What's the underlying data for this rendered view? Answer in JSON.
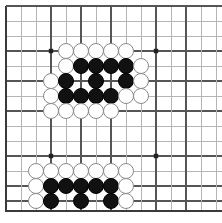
{
  "board": {
    "game": "go",
    "label": "go-board",
    "size": 14,
    "origin_x": 6,
    "origin_y": 6,
    "spacing": 15,
    "stone_radius": 8,
    "cols_visible": 14,
    "rows_visible": 14,
    "colors": {
      "background": "#ffffff",
      "grid_line": "#b5b5b5",
      "grid_line_strong": "#555555",
      "edge_line": "#3a3a3a",
      "black_stone": "#111111",
      "white_stone": "#ffffff",
      "white_stone_border": "#8a8a8a",
      "star_point": "#222222"
    },
    "edges": {
      "left_x": 6,
      "top_y": 6,
      "bottom_y": 211,
      "right_x": 222
    },
    "star_points": [
      {
        "col": 3,
        "row": 3
      },
      {
        "col": 10,
        "row": 3
      },
      {
        "col": 3,
        "row": 10
      },
      {
        "col": 10,
        "row": 10
      }
    ],
    "strong_lines": {
      "vertical_cols": [
        0,
        3,
        5,
        7,
        10,
        12
      ],
      "horizontal_rows": [
        0,
        3,
        5,
        7,
        10,
        12,
        13
      ]
    },
    "stones": [
      {
        "col": 4,
        "row": 3,
        "color": "white"
      },
      {
        "col": 5,
        "row": 3,
        "color": "white"
      },
      {
        "col": 6,
        "row": 3,
        "color": "white"
      },
      {
        "col": 7,
        "row": 3,
        "color": "white"
      },
      {
        "col": 8,
        "row": 3,
        "color": "white"
      },
      {
        "col": 4,
        "row": 4,
        "color": "white"
      },
      {
        "col": 5,
        "row": 4,
        "color": "black"
      },
      {
        "col": 6,
        "row": 4,
        "color": "black"
      },
      {
        "col": 7,
        "row": 4,
        "color": "black"
      },
      {
        "col": 8,
        "row": 4,
        "color": "black"
      },
      {
        "col": 9,
        "row": 4,
        "color": "white"
      },
      {
        "col": 3,
        "row": 5,
        "color": "white"
      },
      {
        "col": 4,
        "row": 5,
        "color": "black"
      },
      {
        "col": 6,
        "row": 5,
        "color": "black"
      },
      {
        "col": 8,
        "row": 5,
        "color": "black"
      },
      {
        "col": 9,
        "row": 5,
        "color": "white"
      },
      {
        "col": 3,
        "row": 6,
        "color": "white"
      },
      {
        "col": 4,
        "row": 6,
        "color": "black"
      },
      {
        "col": 5,
        "row": 6,
        "color": "black"
      },
      {
        "col": 6,
        "row": 6,
        "color": "black"
      },
      {
        "col": 7,
        "row": 6,
        "color": "black"
      },
      {
        "col": 8,
        "row": 6,
        "color": "white"
      },
      {
        "col": 9,
        "row": 6,
        "color": "white"
      },
      {
        "col": 3,
        "row": 7,
        "color": "white"
      },
      {
        "col": 4,
        "row": 7,
        "color": "white"
      },
      {
        "col": 5,
        "row": 7,
        "color": "white"
      },
      {
        "col": 6,
        "row": 7,
        "color": "white"
      },
      {
        "col": 7,
        "row": 7,
        "color": "white"
      },
      {
        "col": 2,
        "row": 11,
        "color": "white"
      },
      {
        "col": 3,
        "row": 11,
        "color": "white"
      },
      {
        "col": 4,
        "row": 11,
        "color": "white"
      },
      {
        "col": 5,
        "row": 11,
        "color": "white"
      },
      {
        "col": 6,
        "row": 11,
        "color": "white"
      },
      {
        "col": 7,
        "row": 11,
        "color": "white"
      },
      {
        "col": 8,
        "row": 11,
        "color": "white"
      },
      {
        "col": 2,
        "row": 12,
        "color": "white"
      },
      {
        "col": 3,
        "row": 12,
        "color": "black"
      },
      {
        "col": 4,
        "row": 12,
        "color": "black"
      },
      {
        "col": 5,
        "row": 12,
        "color": "black"
      },
      {
        "col": 6,
        "row": 12,
        "color": "black"
      },
      {
        "col": 7,
        "row": 12,
        "color": "black"
      },
      {
        "col": 8,
        "row": 12,
        "color": "white"
      },
      {
        "col": 2,
        "row": 13,
        "color": "white"
      },
      {
        "col": 3,
        "row": 13,
        "color": "black"
      },
      {
        "col": 5,
        "row": 13,
        "color": "black"
      },
      {
        "col": 7,
        "row": 13,
        "color": "black"
      },
      {
        "col": 8,
        "row": 13,
        "color": "white"
      }
    ]
  }
}
